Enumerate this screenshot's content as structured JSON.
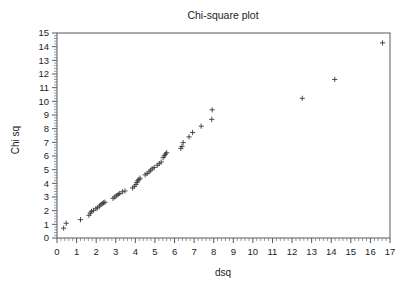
{
  "chart_data": {
    "type": "scatter",
    "title": "Chi-square plot",
    "xlabel": "dsq",
    "ylabel": "Chi sq",
    "xlim": [
      0,
      17
    ],
    "ylim": [
      0,
      15
    ],
    "xticks": [
      0,
      1,
      2,
      3,
      4,
      5,
      6,
      7,
      8,
      9,
      10,
      11,
      12,
      13,
      14,
      15,
      16,
      17
    ],
    "yticks": [
      0,
      1,
      2,
      3,
      4,
      5,
      6,
      7,
      8,
      9,
      10,
      11,
      12,
      13,
      14,
      15
    ],
    "xtick_labels": [
      "0",
      "1",
      "2",
      "3",
      "4",
      "5",
      "6",
      "7",
      "8",
      "9",
      "10",
      "11",
      "12",
      "13",
      "14",
      "15",
      "16",
      "17"
    ],
    "ytick_labels": [
      "0",
      "1",
      "2",
      "3",
      "4",
      "5",
      "6",
      "7",
      "8",
      "9",
      "10",
      "11",
      "12",
      "13",
      "14",
      "15"
    ],
    "minor_tick_interval": 0.2,
    "grid": false,
    "legend": false,
    "marker": "plus",
    "marker_color": "#3a3a3a",
    "series": [
      {
        "name": "Mahalanobis distance vs chi-square quantile",
        "points": [
          [
            0.34,
            0.72
          ],
          [
            0.47,
            1.08
          ],
          [
            1.2,
            1.34
          ],
          [
            1.63,
            1.66
          ],
          [
            1.7,
            1.82
          ],
          [
            1.76,
            1.95
          ],
          [
            1.86,
            2.02
          ],
          [
            1.99,
            2.14
          ],
          [
            2.07,
            2.22
          ],
          [
            2.17,
            2.34
          ],
          [
            2.24,
            2.43
          ],
          [
            2.31,
            2.52
          ],
          [
            2.38,
            2.58
          ],
          [
            2.45,
            2.62
          ],
          [
            2.86,
            2.9
          ],
          [
            2.95,
            3.0
          ],
          [
            3.03,
            3.09
          ],
          [
            3.12,
            3.18
          ],
          [
            3.2,
            3.26
          ],
          [
            3.34,
            3.38
          ],
          [
            3.47,
            3.44
          ],
          [
            3.86,
            3.66
          ],
          [
            3.95,
            3.78
          ],
          [
            4.03,
            3.92
          ],
          [
            4.08,
            4.06
          ],
          [
            4.12,
            4.18
          ],
          [
            4.18,
            4.28
          ],
          [
            4.24,
            4.38
          ],
          [
            4.5,
            4.62
          ],
          [
            4.6,
            4.72
          ],
          [
            4.7,
            4.84
          ],
          [
            4.78,
            4.96
          ],
          [
            4.86,
            5.06
          ],
          [
            4.96,
            5.16
          ],
          [
            5.12,
            5.32
          ],
          [
            5.22,
            5.44
          ],
          [
            5.32,
            5.56
          ],
          [
            5.42,
            5.88
          ],
          [
            5.48,
            6.02
          ],
          [
            5.54,
            6.14
          ],
          [
            5.6,
            6.24
          ],
          [
            6.32,
            6.56
          ],
          [
            6.38,
            6.7
          ],
          [
            6.44,
            6.98
          ],
          [
            6.74,
            7.4
          ],
          [
            6.92,
            7.72
          ],
          [
            7.36,
            8.18
          ],
          [
            7.9,
            8.68
          ],
          [
            7.92,
            9.38
          ],
          [
            12.52,
            10.22
          ],
          [
            14.18,
            11.6
          ],
          [
            16.62,
            14.28
          ]
        ]
      }
    ],
    "layout": {
      "plot_left": 57,
      "plot_right": 390,
      "plot_top": 33,
      "plot_bottom": 238,
      "width": 413,
      "height": 289
    }
  }
}
